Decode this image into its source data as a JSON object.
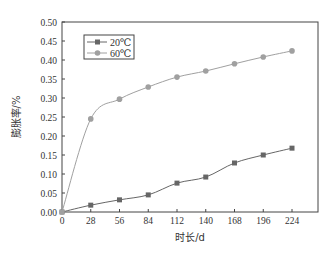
{
  "chart_data": {
    "type": "line",
    "title": "",
    "xlabel": "时长/d",
    "ylabel": "膨胀率/%",
    "x": [
      0,
      28,
      56,
      84,
      112,
      140,
      168,
      196,
      224
    ],
    "xticks": [
      "0",
      "28",
      "56",
      "84",
      "112",
      "140",
      "168",
      "196",
      "224"
    ],
    "yticks": [
      "0.00",
      "0.05",
      "0.10",
      "0.15",
      "0.20",
      "0.25",
      "0.30",
      "0.35",
      "0.40",
      "0.45",
      "0.50"
    ],
    "xlim": [
      0,
      240
    ],
    "ylim": [
      0,
      0.5
    ],
    "grid": false,
    "legend_position": "upper-left",
    "series": [
      {
        "name": "20℃",
        "marker": "square",
        "color": "#666666",
        "values": [
          0.0,
          0.018,
          0.032,
          0.045,
          0.076,
          0.092,
          0.129,
          0.15,
          0.168
        ]
      },
      {
        "name": "60℃",
        "marker": "circle",
        "color": "#a0a0a0",
        "values": [
          0.0,
          0.245,
          0.297,
          0.329,
          0.355,
          0.371,
          0.39,
          0.408,
          0.424
        ]
      }
    ]
  }
}
